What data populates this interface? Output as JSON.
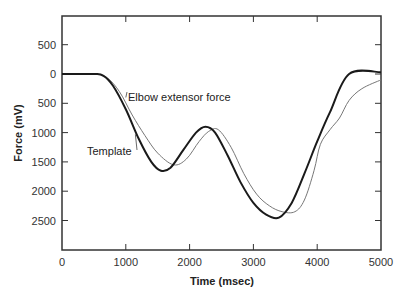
{
  "chart_data": {
    "type": "line",
    "title": "",
    "xlabel": "Time (msec)",
    "ylabel": "Force (mV)",
    "xlim": [
      0,
      5000
    ],
    "ylim_display": [
      -1000,
      3100
    ],
    "y_inverted": true,
    "grid": false,
    "legend": "inline annotations",
    "x_ticks": [
      "0",
      "1000",
      "2000",
      "3000",
      "4000",
      "5000"
    ],
    "y_ticks": [
      {
        "label": "500",
        "value": -500
      },
      {
        "label": "0",
        "value": 0
      },
      {
        "label": "500",
        "value": 500
      },
      {
        "label": "1000",
        "value": 1000
      },
      {
        "label": "1500",
        "value": 1500
      },
      {
        "label": "2000",
        "value": 2000
      },
      {
        "label": "2500",
        "value": 2500
      }
    ],
    "annotations": [
      {
        "text": "Elbow extensor force",
        "target_series": "Elbow extensor force"
      },
      {
        "text": "Template",
        "target_series": "Template"
      }
    ],
    "series": [
      {
        "name": "Template",
        "color": "#1a1a1a",
        "width": 2,
        "x": [
          0,
          500,
          650,
          800,
          1000,
          1200,
          1400,
          1550,
          1700,
          1900,
          2100,
          2250,
          2400,
          2600,
          2800,
          3000,
          3200,
          3400,
          3600,
          3800,
          4000,
          4200,
          4500,
          5000
        ],
        "y": [
          0,
          0,
          30,
          200,
          600,
          1100,
          1500,
          1650,
          1600,
          1300,
          1000,
          900,
          1000,
          1400,
          1850,
          2200,
          2400,
          2450,
          2200,
          1700,
          1150,
          650,
          0,
          -30
        ]
      },
      {
        "name": "Elbow extensor force",
        "color": "#777777",
        "width": 1,
        "x": [
          0,
          500,
          700,
          900,
          1100,
          1300,
          1500,
          1750,
          1950,
          2150,
          2300,
          2450,
          2650,
          2850,
          3050,
          3250,
          3450,
          3650,
          3800,
          3950,
          4050,
          4200,
          4350,
          4500,
          4700,
          5000
        ],
        "y": [
          0,
          0,
          60,
          300,
          700,
          1050,
          1350,
          1550,
          1450,
          1150,
          980,
          950,
          1250,
          1700,
          2050,
          2250,
          2350,
          2350,
          2150,
          1650,
          1200,
          950,
          750,
          450,
          250,
          100
        ]
      }
    ]
  },
  "plot_area": {
    "left_px": 62,
    "right_px": 381,
    "top_px": 16,
    "bottom_px": 250,
    "x_px_per_unit": 0.0638,
    "y_zero_px": 74,
    "y_px_per_unit": 0.0586
  }
}
